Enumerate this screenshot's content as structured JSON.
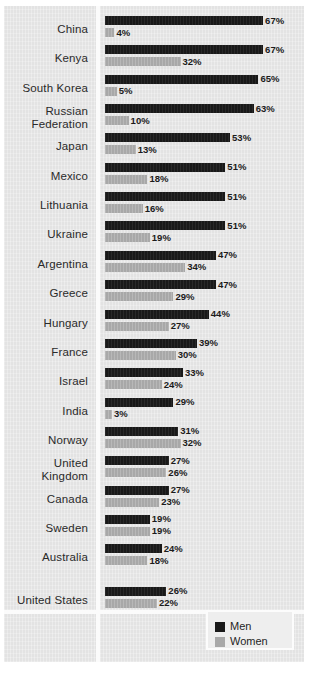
{
  "chart_data": {
    "type": "bar",
    "title": "",
    "subtitle": "",
    "xlabel": "",
    "ylabel": "",
    "orientation": "horizontal",
    "grid": false,
    "value_suffix": "%",
    "xlim": [
      0,
      67
    ],
    "legend_position": "bottom-right",
    "legend": [
      "Men",
      "Women"
    ],
    "series": [
      {
        "name": "Men",
        "color": "#191919",
        "values": [
          67,
          67,
          65,
          63,
          53,
          51,
          51,
          51,
          47,
          47,
          44,
          39,
          33,
          29,
          31,
          27,
          27,
          19,
          24,
          26
        ]
      },
      {
        "name": "Women",
        "color": "#a8a8a8",
        "values": [
          4,
          32,
          5,
          10,
          13,
          18,
          16,
          19,
          34,
          29,
          27,
          30,
          24,
          3,
          32,
          26,
          23,
          19,
          18,
          22
        ]
      }
    ],
    "categories": [
      "China",
      "Kenya",
      "South Korea",
      "Russian\nFederation",
      "Japan",
      "Mexico",
      "Lithuania",
      "Ukraine",
      "Argentina",
      "Greece",
      "Hungary",
      "France",
      "Israel",
      "India",
      "Norway",
      "United\nKingdom",
      "Canada",
      "Sweden",
      "Australia",
      "United States"
    ],
    "rows": [
      {
        "label": "China",
        "men": 67,
        "women": 4,
        "men_text": "67%",
        "women_text": "4%",
        "two_line": false,
        "separated": false
      },
      {
        "label": "Kenya",
        "men": 67,
        "women": 32,
        "men_text": "67%",
        "women_text": "32%",
        "two_line": false,
        "separated": false
      },
      {
        "label": "South Korea",
        "men": 65,
        "women": 5,
        "men_text": "65%",
        "women_text": "5%",
        "two_line": false,
        "separated": false
      },
      {
        "label": "Russian\nFederation",
        "men": 63,
        "women": 10,
        "men_text": "63%",
        "women_text": "10%",
        "two_line": true,
        "separated": false
      },
      {
        "label": "Japan",
        "men": 53,
        "women": 13,
        "men_text": "53%",
        "women_text": "13%",
        "two_line": false,
        "separated": false
      },
      {
        "label": "Mexico",
        "men": 51,
        "women": 18,
        "men_text": "51%",
        "women_text": "18%",
        "two_line": false,
        "separated": false
      },
      {
        "label": "Lithuania",
        "men": 51,
        "women": 16,
        "men_text": "51%",
        "women_text": "16%",
        "two_line": false,
        "separated": false
      },
      {
        "label": "Ukraine",
        "men": 51,
        "women": 19,
        "men_text": "51%",
        "women_text": "19%",
        "two_line": false,
        "separated": false
      },
      {
        "label": "Argentina",
        "men": 47,
        "women": 34,
        "men_text": "47%",
        "women_text": "34%",
        "two_line": false,
        "separated": false
      },
      {
        "label": "Greece",
        "men": 47,
        "women": 29,
        "men_text": "47%",
        "women_text": "29%",
        "two_line": false,
        "separated": false
      },
      {
        "label": "Hungary",
        "men": 44,
        "women": 27,
        "men_text": "44%",
        "women_text": "27%",
        "two_line": false,
        "separated": false
      },
      {
        "label": "France",
        "men": 39,
        "women": 30,
        "men_text": "39%",
        "women_text": "30%",
        "two_line": false,
        "separated": false
      },
      {
        "label": "Israel",
        "men": 33,
        "women": 24,
        "men_text": "33%",
        "women_text": "24%",
        "two_line": false,
        "separated": false
      },
      {
        "label": "India",
        "men": 29,
        "women": 3,
        "men_text": "29%",
        "women_text": "3%",
        "two_line": false,
        "separated": false
      },
      {
        "label": "Norway",
        "men": 31,
        "women": 32,
        "men_text": "31%",
        "women_text": "32%",
        "two_line": false,
        "separated": false
      },
      {
        "label": "United\nKingdom",
        "men": 27,
        "women": 26,
        "men_text": "27%",
        "women_text": "26%",
        "two_line": true,
        "separated": false
      },
      {
        "label": "Canada",
        "men": 27,
        "women": 23,
        "men_text": "27%",
        "women_text": "23%",
        "two_line": false,
        "separated": false
      },
      {
        "label": "Sweden",
        "men": 19,
        "women": 19,
        "men_text": "19%",
        "women_text": "19%",
        "two_line": false,
        "separated": false
      },
      {
        "label": "Australia",
        "men": 24,
        "women": 18,
        "men_text": "24%",
        "women_text": "18%",
        "two_line": false,
        "separated": false
      },
      {
        "label": "United States",
        "men": 26,
        "women": 22,
        "men_text": "26%",
        "women_text": "22%",
        "two_line": false,
        "separated": true
      }
    ]
  },
  "legend": {
    "men_label": "Men",
    "women_label": "Women"
  },
  "colors": {
    "men": "#191919",
    "women": "#a8a8a8",
    "panel": "#e3e3e3",
    "divider": "#fbfbfb",
    "text": "#2a2a2a"
  }
}
